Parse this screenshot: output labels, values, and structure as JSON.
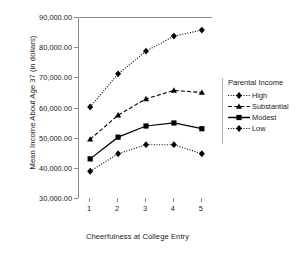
{
  "chart_data": {
    "type": "line",
    "title": "",
    "xlabel": "Cheerfulness at College Entry",
    "ylabel": "Mean Income About Age 37 (in dollars)",
    "x": [
      1,
      2,
      3,
      4,
      5
    ],
    "categories": [
      "1",
      "2",
      "3",
      "4",
      "5"
    ],
    "xtick_labels": [
      "1",
      "2",
      "3",
      "4",
      "5"
    ],
    "ytick_labels": [
      "90,000.00",
      "80,000.00",
      "70,000.00",
      "60,000.00",
      "50,000.00",
      "40,000.00",
      "30,000.00"
    ],
    "ytick_values": [
      90000,
      80000,
      70000,
      60000,
      50000,
      40000,
      30000
    ],
    "ylim": [
      30000,
      90000
    ],
    "xlim": [
      0.6,
      5.4
    ],
    "grid": false,
    "legend_position": "right",
    "legend_title": "Parental Income",
    "series": [
      {
        "name": "High",
        "values": [
          60500,
          71500,
          79000,
          84000,
          86000
        ],
        "marker": "diamond",
        "linestyle": "dotted",
        "color": "#000000"
      },
      {
        "name": "Substantial",
        "values": [
          49800,
          57800,
          63200,
          66000,
          65300
        ],
        "marker": "triangle",
        "linestyle": "dashed",
        "color": "#000000"
      },
      {
        "name": "Modest",
        "values": [
          43300,
          50500,
          54200,
          55200,
          53300
        ],
        "marker": "square",
        "linestyle": "solid",
        "color": "#000000"
      },
      {
        "name": "Low",
        "values": [
          39200,
          45000,
          48000,
          48000,
          45000
        ],
        "marker": "diamond",
        "linestyle": "dashdot",
        "color": "#000000"
      }
    ]
  },
  "axis_color": "#8a8a8a",
  "text_color": "#1a1a1a"
}
